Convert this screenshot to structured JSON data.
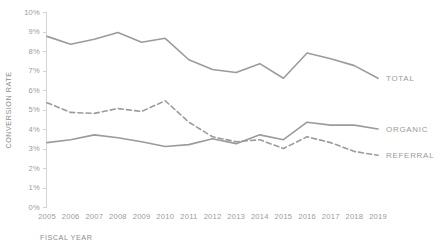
{
  "chart_data": {
    "type": "line",
    "title": "",
    "xlabel": "FISCAL YEAR",
    "ylabel": "CONVERSION RATE",
    "categories": [
      "2005",
      "2006",
      "2007",
      "2008",
      "2009",
      "2010",
      "2011",
      "2012",
      "2013",
      "2014",
      "2015",
      "2016",
      "2017",
      "2018",
      "2019"
    ],
    "x": [
      2005,
      2006,
      2007,
      2008,
      2009,
      2010,
      2011,
      2012,
      2013,
      2014,
      2015,
      2016,
      2017,
      2018,
      2019
    ],
    "ylim": [
      0,
      10
    ],
    "xlim": [
      2005,
      2019
    ],
    "y_tick_labels": [
      "0%",
      "1%",
      "2%",
      "3%",
      "4%",
      "5%",
      "6%",
      "7%",
      "8%",
      "9%",
      "10%"
    ],
    "y_ticks": [
      0,
      1,
      2,
      3,
      4,
      5,
      6,
      7,
      8,
      9,
      10
    ],
    "y_unit": "%",
    "grid": false,
    "legend_position": "line-end-labels",
    "series": [
      {
        "name": "TOTAL",
        "style": "solid",
        "color": "#9b9b9b",
        "values": [
          8.75,
          8.35,
          8.6,
          8.95,
          8.45,
          8.65,
          7.55,
          7.05,
          6.9,
          7.35,
          6.6,
          7.9,
          7.6,
          7.25,
          6.6
        ]
      },
      {
        "name": "ORGANIC",
        "style": "solid",
        "color": "#9b9b9b",
        "values": [
          3.3,
          3.45,
          3.7,
          3.55,
          3.35,
          3.1,
          3.2,
          3.5,
          3.25,
          3.7,
          3.45,
          4.35,
          4.2,
          4.2,
          4.0
        ]
      },
      {
        "name": "REFERRAL",
        "style": "dashed",
        "color": "#9b9b9b",
        "values": [
          5.35,
          4.85,
          4.8,
          5.05,
          4.9,
          5.45,
          4.35,
          3.6,
          3.35,
          3.45,
          3.0,
          3.6,
          3.3,
          2.85,
          2.65
        ]
      }
    ],
    "series_end_labels": [
      "TOTAL",
      "ORGANIC",
      "REFERRAL"
    ]
  },
  "axes": {
    "y_axis_title": "CONVERSION RATE",
    "x_axis_title": "FISCAL YEAR"
  }
}
